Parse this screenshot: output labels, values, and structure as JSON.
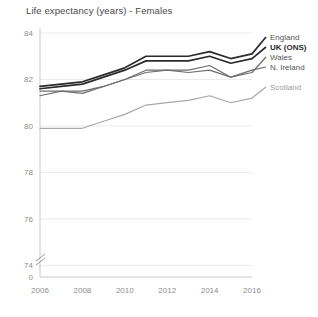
{
  "chart_data": {
    "type": "line",
    "title": "Life expectancy (years) - Females",
    "xlabel": "",
    "ylabel": "",
    "xlim": [
      2006,
      2016
    ],
    "ylim": [
      74,
      84
    ],
    "axis_break": true,
    "axis_break_label": "0",
    "grid": true,
    "legend_position": "right",
    "x": [
      2006,
      2007,
      2008,
      2009,
      2010,
      2011,
      2012,
      2013,
      2014,
      2015,
      2016
    ],
    "categories": [
      "2006",
      "2007",
      "2008",
      "2009",
      "2010",
      "2011",
      "2012",
      "2013",
      "2014",
      "2015",
      "2016"
    ],
    "yticks": [
      84,
      82,
      80,
      78,
      76,
      74
    ],
    "ytick_labels": [
      "84",
      "82",
      "80",
      "78",
      "76",
      "74"
    ],
    "xticks": [
      2006,
      2008,
      2010,
      2012,
      2014,
      2016
    ],
    "xtick_labels": [
      "2006",
      "2008",
      "2010",
      "2012",
      "2014",
      "2016"
    ],
    "series": [
      {
        "name": "England",
        "color": "#2b2b2b",
        "width": 1.7,
        "values": [
          81.7,
          81.8,
          81.9,
          82.2,
          82.5,
          83.0,
          83.0,
          83.0,
          83.2,
          82.9,
          83.1
        ]
      },
      {
        "name": "UK (ONS)",
        "color": "#2b2b2b",
        "width": 1.7,
        "values": [
          81.6,
          81.7,
          81.8,
          82.1,
          82.4,
          82.8,
          82.8,
          82.8,
          83.0,
          82.7,
          82.9
        ]
      },
      {
        "name": "Wales",
        "color": "#6e6e6e",
        "width": 1.2,
        "values": [
          81.5,
          81.5,
          81.4,
          81.7,
          82.0,
          82.4,
          82.4,
          82.3,
          82.4,
          82.1,
          82.3
        ]
      },
      {
        "name": "N. Ireland",
        "color": "#6e6e6e",
        "width": 1.2,
        "values": [
          81.3,
          81.5,
          81.5,
          81.7,
          82.0,
          82.3,
          82.4,
          82.4,
          82.6,
          82.1,
          82.4
        ]
      },
      {
        "name": "Scotland",
        "color": "#a8a8a8",
        "width": 1.2,
        "values": [
          79.9,
          79.9,
          79.9,
          80.2,
          80.5,
          80.9,
          81.0,
          81.1,
          81.3,
          81.0,
          81.2
        ]
      }
    ]
  },
  "legend": {
    "items": [
      {
        "label": "England",
        "emphasis": "normal"
      },
      {
        "label": "UK (ONS)",
        "emphasis": "bold"
      },
      {
        "label": "Wales",
        "emphasis": "normal"
      },
      {
        "label": "N. Ireland",
        "emphasis": "normal"
      },
      {
        "label": "Scotland",
        "emphasis": "light"
      }
    ]
  }
}
